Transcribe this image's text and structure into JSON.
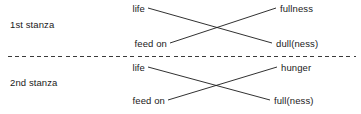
{
  "diagram": {
    "type": "crossed-correspondence-diagram",
    "width": 361,
    "height": 114,
    "line_color": "#1a1a1a",
    "divider_color": "#3a3a3a",
    "background_color": "#ffffff",
    "stanzas": [
      {
        "id": "stanza-1",
        "label": "1st stanza",
        "left_terms": [
          "life",
          "feed on"
        ],
        "right_terms": [
          "fullness",
          "dull(ness)"
        ],
        "links": [
          {
            "from": "life",
            "to": "dull(ness)"
          },
          {
            "from": "feed on",
            "to": "fullness"
          }
        ]
      },
      {
        "id": "stanza-2",
        "label": "2nd stanza",
        "left_terms": [
          "life",
          "feed on"
        ],
        "right_terms": [
          "hunger",
          "full(ness)"
        ],
        "links": [
          {
            "from": "life",
            "to": "full(ness)"
          },
          {
            "from": "feed on",
            "to": "hunger"
          }
        ]
      }
    ],
    "divider": {
      "style": "dashed",
      "x_start": 8,
      "x_end": 356,
      "y": 56
    }
  }
}
